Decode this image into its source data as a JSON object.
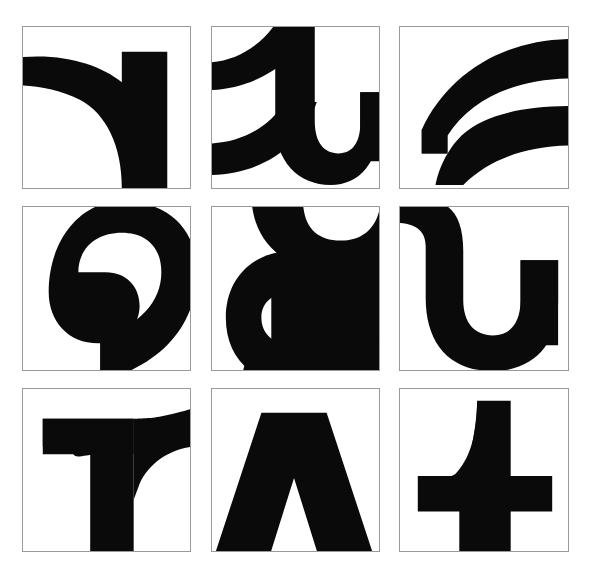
{
  "figure": {
    "background_color": "#ffffff",
    "ink_color": "#0a0a0a",
    "frame_color": "#9a9a9a",
    "rows": 3,
    "columns": 3,
    "panel_count": 9
  },
  "panels": [
    {
      "id": "panel-1",
      "position": "row 1, column 1",
      "label": "r-shoulder",
      "description": "Black shoulder-and-stem form: thick curved arc sweeping from the left edge up to a vertical bar on the right.",
      "glyph": "r",
      "orientation": "upright"
    },
    {
      "id": "panel-2",
      "position": "row 1, column 2",
      "label": "a-bowl-and-tail",
      "description": "Black bowl with a descending hook, two strokes crossing to the left edge.",
      "glyph": "a",
      "orientation": "upright"
    },
    {
      "id": "panel-3",
      "position": "row 1, column 3",
      "label": "e-crossbar",
      "description": "Two thick tapering strokes converging toward the left, forming an open wedge.",
      "glyph": "e",
      "orientation": "rotated"
    },
    {
      "id": "panel-4",
      "position": "row 2, column 1",
      "label": "spiral-bowl",
      "description": "Large black spiral curling inward counter-clockwise with a round white eye.",
      "glyph": "a",
      "orientation": "rotated"
    },
    {
      "id": "panel-5",
      "position": "row 2, column 2",
      "label": "g-double-bowl",
      "description": "Stacked bowl shapes with white channels, resembling a double-storey g turned on its side.",
      "glyph": "g",
      "orientation": "rotated"
    },
    {
      "id": "panel-6",
      "position": "row 2, column 3",
      "label": "u-hook",
      "description": "Heavy U-shaped hook with a curved top-left entry stroke.",
      "glyph": "u",
      "orientation": "upright"
    },
    {
      "id": "panel-7",
      "position": "row 3, column 1",
      "label": "r-mirrored",
      "description": "Mirrored r: flat flag to the left, vertical stem, curved shoulder rising to the right edge.",
      "glyph": "r",
      "orientation": "mirrored"
    },
    {
      "id": "panel-8",
      "position": "row 3, column 2",
      "label": "inverted-v",
      "description": "Solid inverted V (A without crossbar) with splayed legs reaching the bottom edge.",
      "glyph": "v",
      "orientation": "inverted"
    },
    {
      "id": "panel-9",
      "position": "row 3, column 3",
      "label": "t-cross",
      "description": "Thick cross / t form: vertical stem with a tapering top curve and a broad horizontal bar.",
      "glyph": "t",
      "orientation": "upright"
    }
  ]
}
